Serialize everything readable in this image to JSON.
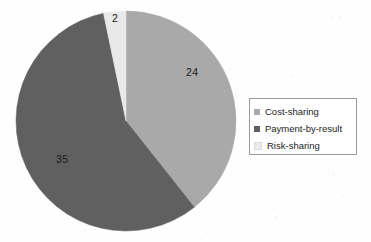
{
  "chart_data": {
    "type": "pie",
    "title": "",
    "labels": [
      "Cost-sharing",
      "Payment-by-result",
      "Risk-sharing"
    ],
    "values": [
      24,
      35,
      2
    ],
    "total": 61,
    "data_labels": [
      "24",
      "35",
      "2"
    ],
    "colors": [
      "#a9a9a9",
      "#606060",
      "#e9e9e9"
    ],
    "legend_position": "right",
    "grid": false,
    "start_angle_deg": 0,
    "direction": "clockwise",
    "slices": [
      {
        "label": "Cost-sharing",
        "value": 24,
        "data_label": "24",
        "color": "#a9a9a9",
        "start_deg": 0,
        "end_deg": 141.6
      },
      {
        "label": "Payment-by-result",
        "value": 35,
        "data_label": "35",
        "color": "#606060",
        "start_deg": 141.6,
        "end_deg": 348.2
      },
      {
        "label": "Risk-sharing",
        "value": 2,
        "data_label": "2",
        "color": "#e9e9e9",
        "start_deg": 348.2,
        "end_deg": 360
      }
    ]
  },
  "legend": {
    "items": [
      {
        "label": "Cost-sharing",
        "color": "#a9a9a9"
      },
      {
        "label": "Payment-by-result",
        "color": "#606060"
      },
      {
        "label": "Risk-sharing",
        "color": "#e9e9e9"
      }
    ]
  },
  "geometry": {
    "center_x": 126,
    "center_y": 121,
    "radius": 110
  }
}
